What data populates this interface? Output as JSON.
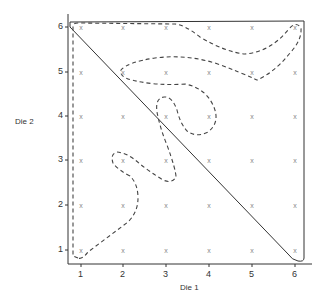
{
  "chart_data": {
    "type": "scatter",
    "title": "",
    "xlabel": "Die 1",
    "ylabel": "Die 2",
    "x_ticks": [
      "1",
      "2",
      "3",
      "4",
      "5",
      "6"
    ],
    "y_ticks": [
      "1",
      "2",
      "3",
      "4",
      "5",
      "6"
    ],
    "xlim": [
      0.7,
      6.3
    ],
    "ylim": [
      0.7,
      6.3
    ],
    "grid": false,
    "point_marker": "x",
    "points": "all 36 outcomes (i, j) for i, j in 1..6",
    "annotations": [
      "solid closed region bounded by diagonal from (1,6) to (6,1) plus top and right borders",
      "dashed irregular closed region containing a scattered subset of outcomes"
    ]
  },
  "axes": {
    "x_label": "Die 1",
    "y_label": "Die 2",
    "x_ticks": [
      "1",
      "2",
      "3",
      "4",
      "5",
      "6"
    ],
    "y_ticks": [
      "1",
      "2",
      "3",
      "4",
      "5",
      "6"
    ]
  },
  "marker": "x"
}
